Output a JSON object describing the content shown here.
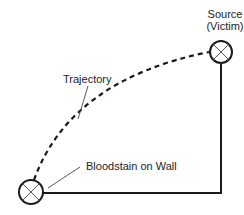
{
  "diagram": {
    "source_label_line1": "Source",
    "source_label_line2": "(Victim)",
    "trajectory_label": "Trajectory",
    "bloodstain_label": "Bloodstain on Wall",
    "colors": {
      "stroke": "#1a1a1a",
      "leader": "#444444",
      "background": "#ffffff"
    },
    "nodes": [
      {
        "id": "source",
        "symbol": "circle-x-icon",
        "cx": 221,
        "cy": 52,
        "r": 11
      },
      {
        "id": "bloodstain",
        "symbol": "circle-x-icon",
        "cx": 31,
        "cy": 192,
        "r": 12
      }
    ]
  }
}
